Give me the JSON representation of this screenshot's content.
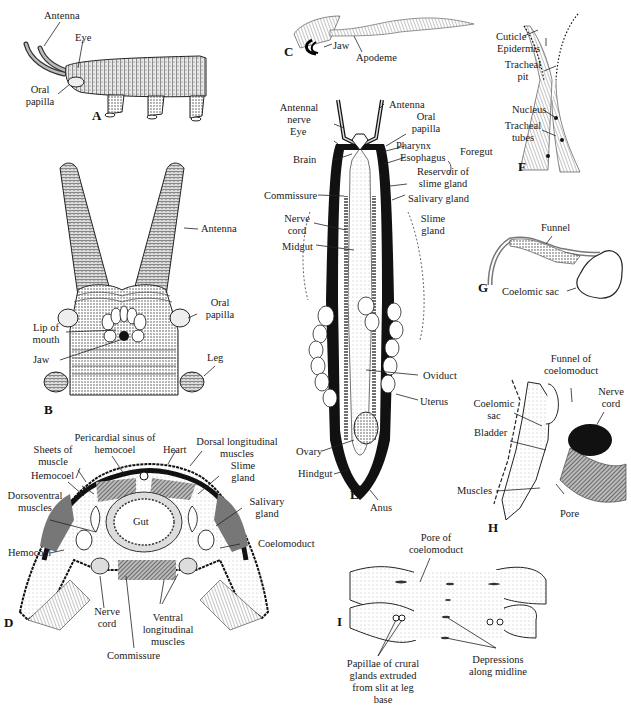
{
  "figure": {
    "panels": {
      "A": {
        "letter": "A",
        "subject": "external lateral view of animal",
        "labels": {
          "antenna": "Antenna",
          "eye": "Eye",
          "oral_papilla": "Oral papilla"
        }
      },
      "B": {
        "letter": "B",
        "subject": "ventral view of head",
        "labels": {
          "antenna": "Antenna",
          "oral_papilla": "Oral papilla",
          "lip_of_mouth": "Lip of mouth",
          "jaw": "Jaw",
          "leg": "Leg"
        }
      },
      "C": {
        "letter": "C",
        "subject": "jaw and apodeme",
        "labels": {
          "jaw": "Jaw",
          "apodeme": "Apodeme"
        }
      },
      "D": {
        "letter": "D",
        "subject": "transverse section through body",
        "labels": {
          "pericardial_sinus": "Pericardial sinus of hemocoel",
          "sheets_of_muscle": "Sheets of muscle",
          "hemocoel_upper": "Hemocoel",
          "dorsoventral_muscles": "Dorsoventral muscles",
          "hemocoel_lower": "Hemocoel",
          "heart": "Heart",
          "dorsal_longitudinal_muscles": "Dorsal longitudinal muscles",
          "slime_gland": "Slime gland",
          "salivary_gland": "Salivary gland",
          "coelomoduct": "Coelomoduct",
          "gut": "Gut",
          "nerve_cord": "Nerve cord",
          "ventral_longitudinal_muscles": "Ventral longitudinal muscles",
          "commissure": "Commissure"
        }
      },
      "E": {
        "letter": "E",
        "subject": "internal dorsal dissection",
        "labels": {
          "antennal_nerve": "Antennal nerve",
          "antenna": "Antenna",
          "eye": "Eye",
          "oral_papilla": "Oral papilla",
          "pharynx": "Pharynx",
          "esophagus": "Esophagus",
          "foregut": "Foregut",
          "brain": "Brain",
          "reservoir_slime_gland": "Reservoir of slime gland",
          "commissure": "Commissure",
          "salivary_gland": "Salivary gland",
          "nerve_cord": "Nerve cord",
          "slime_gland": "Slime gland",
          "midgut": "Midgut",
          "oviduct": "Oviduct",
          "uterus": "Uterus",
          "ovary": "Ovary",
          "hindgut": "Hindgut",
          "anus": "Anus"
        }
      },
      "F": {
        "letter": "F",
        "subject": "tracheal pit",
        "labels": {
          "cuticle": "Cuticle",
          "epidermis": "Epidermis",
          "tracheal_pit": "Tracheal pit",
          "nucleus": "Nucleus",
          "tracheal_tubes": "Tracheal tubes"
        }
      },
      "G": {
        "letter": "G",
        "subject": "coelomoduct",
        "labels": {
          "funnel": "Funnel",
          "coelomic_sac": "Coelomic sac"
        }
      },
      "H": {
        "letter": "H",
        "subject": "section through leg base",
        "labels": {
          "funnel_of_coelomoduct": "Funnel of coelomoduct",
          "nerve_cord": "Nerve cord",
          "coelomic_sac": "Coelomic sac",
          "bladder": "Bladder",
          "muscles": "Muscles",
          "pore": "Pore"
        }
      },
      "I": {
        "letter": "I",
        "subject": "ventral surface between legs",
        "labels": {
          "pore_of_coelomoduct": "Pore of coelomoduct",
          "papillae": "Papillae of crural glands extruded from slit at leg base",
          "depressions": "Depressions along midline"
        }
      }
    }
  }
}
